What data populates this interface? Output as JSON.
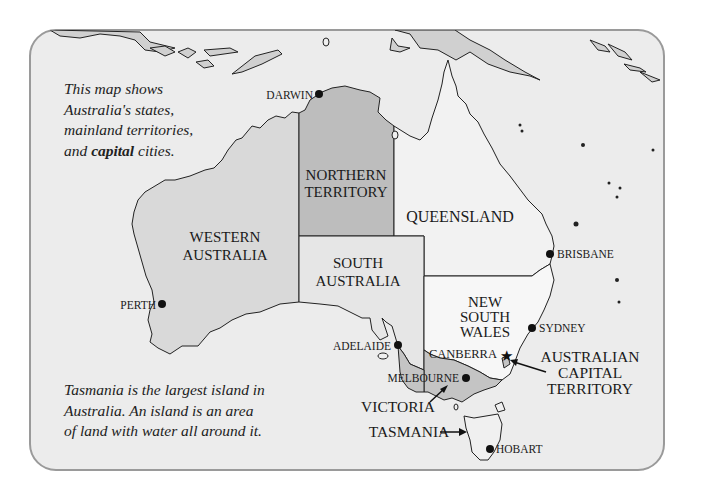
{
  "map": {
    "title": "Australia's states, mainland territories, and capital cities",
    "intro_note": {
      "line1": "This map shows",
      "line2": "Australia's states,",
      "line3": "mainland territories,",
      "line4_pre": "and ",
      "line4_bold": "capital",
      "line4_post": " cities."
    },
    "tasmania_note": {
      "line1": "Tasmania is the largest island in",
      "line2": "Australia. An island is an area",
      "line3": "of land with water all around it."
    },
    "regions": [
      {
        "id": "western-australia",
        "line1": "WESTERN",
        "line2": "AUSTRALIA",
        "fill": "#d9d9d9"
      },
      {
        "id": "northern-territory",
        "line1": "NORTHERN",
        "line2": "TERRITORY",
        "fill": "#bdbdbd"
      },
      {
        "id": "queensland",
        "line1": "QUEENSLAND",
        "fill": "#f2f2f2"
      },
      {
        "id": "south-australia",
        "line1": "SOUTH",
        "line2": "AUSTRALIA",
        "fill": "#e6e6e6"
      },
      {
        "id": "new-south-wales",
        "line1": "NEW",
        "line2": "SOUTH",
        "line3": "WALES",
        "fill": "#f7f7f7"
      },
      {
        "id": "victoria",
        "line1": "VICTORIA",
        "fill": "#c4c4c4"
      },
      {
        "id": "tasmania",
        "line1": "TASMANIA",
        "fill": "#f0f0f0"
      },
      {
        "id": "australian-capital-territory",
        "line1": "AUSTRALIAN",
        "line2": "CAPITAL",
        "line3": "TERRITORY",
        "fill": "#c4c4c4"
      }
    ],
    "cities": [
      {
        "name": "DARWIN",
        "type": "dot"
      },
      {
        "name": "BRISBANE",
        "type": "dot"
      },
      {
        "name": "PERTH",
        "type": "dot"
      },
      {
        "name": "SYDNEY",
        "type": "dot"
      },
      {
        "name": "ADELAIDE",
        "type": "dot"
      },
      {
        "name": "CANBERRA",
        "type": "star"
      },
      {
        "name": "MELBOURNE",
        "type": "dot"
      },
      {
        "name": "HOBART",
        "type": "dot"
      }
    ],
    "colors": {
      "background": "#ececec",
      "ocean": "#ececec",
      "border": "#9a9a9a",
      "coastline": "#222222",
      "neighbor_land": "#d0d0d0"
    }
  }
}
